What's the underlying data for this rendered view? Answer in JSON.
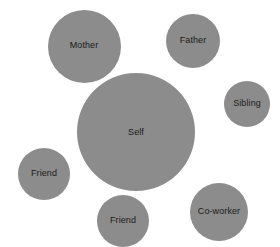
{
  "diagram": {
    "type": "bubble-relationship-map",
    "background_color": "#ffffff",
    "node_fill_color": "#8c8c8c",
    "label_color": "#1a1a1a",
    "canvas": {
      "width": 280,
      "height": 247
    },
    "nodes": [
      {
        "id": "mother",
        "label": "Mother",
        "cx": 84,
        "cy": 46,
        "diameter": 73,
        "label_dx": 0,
        "label_dy": -1,
        "layer": "back"
      },
      {
        "id": "father",
        "label": "Father",
        "cx": 193,
        "cy": 41,
        "diameter": 54,
        "label_dx": 0,
        "label_dy": -1,
        "layer": "back"
      },
      {
        "id": "sibling",
        "label": "Sibling",
        "cx": 247,
        "cy": 104,
        "diameter": 46,
        "label_dx": 0,
        "label_dy": -1,
        "layer": "back"
      },
      {
        "id": "self",
        "label": "Self",
        "cx": 136,
        "cy": 132,
        "diameter": 118,
        "label_dx": 0,
        "label_dy": 0,
        "layer": "mid"
      },
      {
        "id": "friend-left",
        "label": "Friend",
        "cx": 44,
        "cy": 174,
        "diameter": 52,
        "label_dx": 0,
        "label_dy": -1,
        "layer": "front"
      },
      {
        "id": "friend-bottom",
        "label": "Friend",
        "cx": 123,
        "cy": 221,
        "diameter": 52,
        "label_dx": 0,
        "label_dy": -1,
        "layer": "front"
      },
      {
        "id": "co-worker",
        "label": "Co-worker",
        "cx": 219,
        "cy": 212,
        "diameter": 58,
        "label_dx": 0,
        "label_dy": -1,
        "layer": "front"
      }
    ]
  }
}
